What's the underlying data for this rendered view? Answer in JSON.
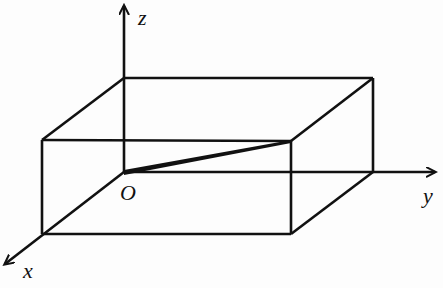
{
  "figure": {
    "type": "3d-coordinate-diagram",
    "axes": {
      "x": {
        "label": "x"
      },
      "y": {
        "label": "y"
      },
      "z": {
        "label": "z"
      }
    },
    "origin_label": "O",
    "caption": "",
    "colors": {
      "line": "#111111",
      "background": "#fdfdfd"
    }
  }
}
